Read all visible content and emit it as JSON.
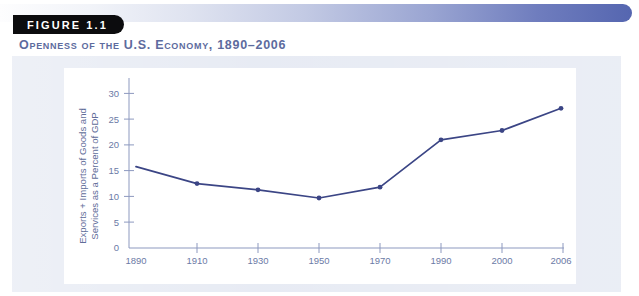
{
  "figure": {
    "badge_label": "FIGURE 1.1",
    "title": "Openness of the U.S. Economy, 1890–2006"
  },
  "colors": {
    "banner_end": "#5566b0",
    "badge_bg": "#0c0c0e",
    "title": "#5d6b9e",
    "panel_bg": "#e6eaf3",
    "card_bg": "#ffffff",
    "line": "#3b4585",
    "axis": "#8d99bf",
    "tick_text": "#6c7aa6"
  },
  "chart_data": {
    "type": "line",
    "title": "Openness of the U.S. Economy, 1890–2006",
    "xlabel": "",
    "ylabel": "Exports + Imports of Goods and Services as a Percent of GDP",
    "categories": [
      "1890",
      "1910",
      "1930",
      "1950",
      "1970",
      "1990",
      "2000",
      "2006"
    ],
    "values": [
      15.8,
      12.5,
      11.3,
      9.7,
      11.8,
      21.0,
      22.8,
      27.1
    ],
    "series": [
      {
        "name": "Exports + Imports of Goods and Services as a Percent of GDP",
        "values": [
          15.8,
          12.5,
          11.3,
          9.7,
          11.8,
          21.0,
          22.8,
          27.1
        ]
      }
    ],
    "yticks": [
      0,
      5,
      10,
      15,
      20,
      25,
      30
    ],
    "ytick_labels": [
      "0",
      "5",
      "10",
      "15",
      "20",
      "25",
      "30"
    ],
    "xtick_labels": [
      "1890",
      "1910",
      "1930",
      "1950",
      "1970",
      "1990",
      "2000",
      "2006"
    ],
    "ylim": [
      0,
      32
    ],
    "grid": false,
    "legend": false,
    "markers": true,
    "marker_shown_at": [
      "1910",
      "1930",
      "1950",
      "1970",
      "1990",
      "2000",
      "2006"
    ]
  },
  "axis": {
    "ylabel_line1": "Exports + Imports of Goods and",
    "ylabel_line2": "Services as a Percent of GDP"
  }
}
